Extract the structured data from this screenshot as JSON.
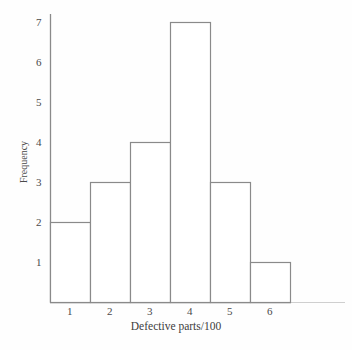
{
  "chart_data": {
    "type": "bar",
    "title": "",
    "subtitle": "",
    "xlabel": "Defective parts/100",
    "ylabel": "Frequency",
    "categories": [
      "1",
      "2",
      "3",
      "4",
      "5",
      "6"
    ],
    "values": [
      2,
      3,
      4,
      7,
      3,
      1
    ],
    "series": [
      {
        "name": "Frequency",
        "values": [
          2,
          3,
          4,
          7,
          3,
          1
        ]
      }
    ],
    "x_tick_labels": [
      "1",
      "2",
      "3",
      "4",
      "5",
      "6"
    ],
    "y_tick_labels": [
      "1",
      "2",
      "3",
      "4",
      "5",
      "6",
      "7"
    ],
    "y_tick_values": [
      1,
      2,
      3,
      4,
      5,
      6,
      7
    ],
    "xlim": [
      0.5,
      6.5
    ],
    "ylim": [
      0,
      7.3
    ],
    "grid": false,
    "legend": false,
    "legend_position": "none",
    "bar_fill": "#ffffff",
    "bar_edge_color": "#8a8a8a",
    "axis_color": "#8a8a8a",
    "text_color": "#3d3d3d",
    "background": "#fefefe",
    "annotations": []
  },
  "figure": {
    "name": "histogram-defective-parts"
  }
}
